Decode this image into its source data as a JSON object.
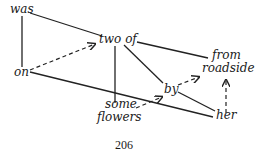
{
  "diagram": {
    "words": {
      "was": "was",
      "two_of": "two of",
      "from": "from",
      "roadside": "roadside",
      "on": "on",
      "by": "by",
      "some": "some",
      "flowers": "flowers",
      "her": "her"
    },
    "page_number": "206",
    "edges": [
      {
        "from": "was",
        "to": "two of",
        "style": "solid"
      },
      {
        "from": "was",
        "to": "on",
        "style": "solid"
      },
      {
        "from": "on",
        "to": "two of",
        "style": "dashed-arrow"
      },
      {
        "from": "two of",
        "to": "from roadside",
        "style": "solid"
      },
      {
        "from": "two of",
        "to": "by",
        "style": "solid"
      },
      {
        "from": "two of",
        "to": "some flowers",
        "style": "solid"
      },
      {
        "from": "on",
        "to": "her",
        "style": "solid"
      },
      {
        "from": "some",
        "to": "by",
        "style": "dashed-arrow"
      },
      {
        "from": "by",
        "to": "roadside",
        "style": "dashed-arrow"
      },
      {
        "from": "by",
        "to": "her",
        "style": "solid"
      },
      {
        "from": "her",
        "to": "roadside",
        "style": "dashed-arrow"
      }
    ]
  }
}
